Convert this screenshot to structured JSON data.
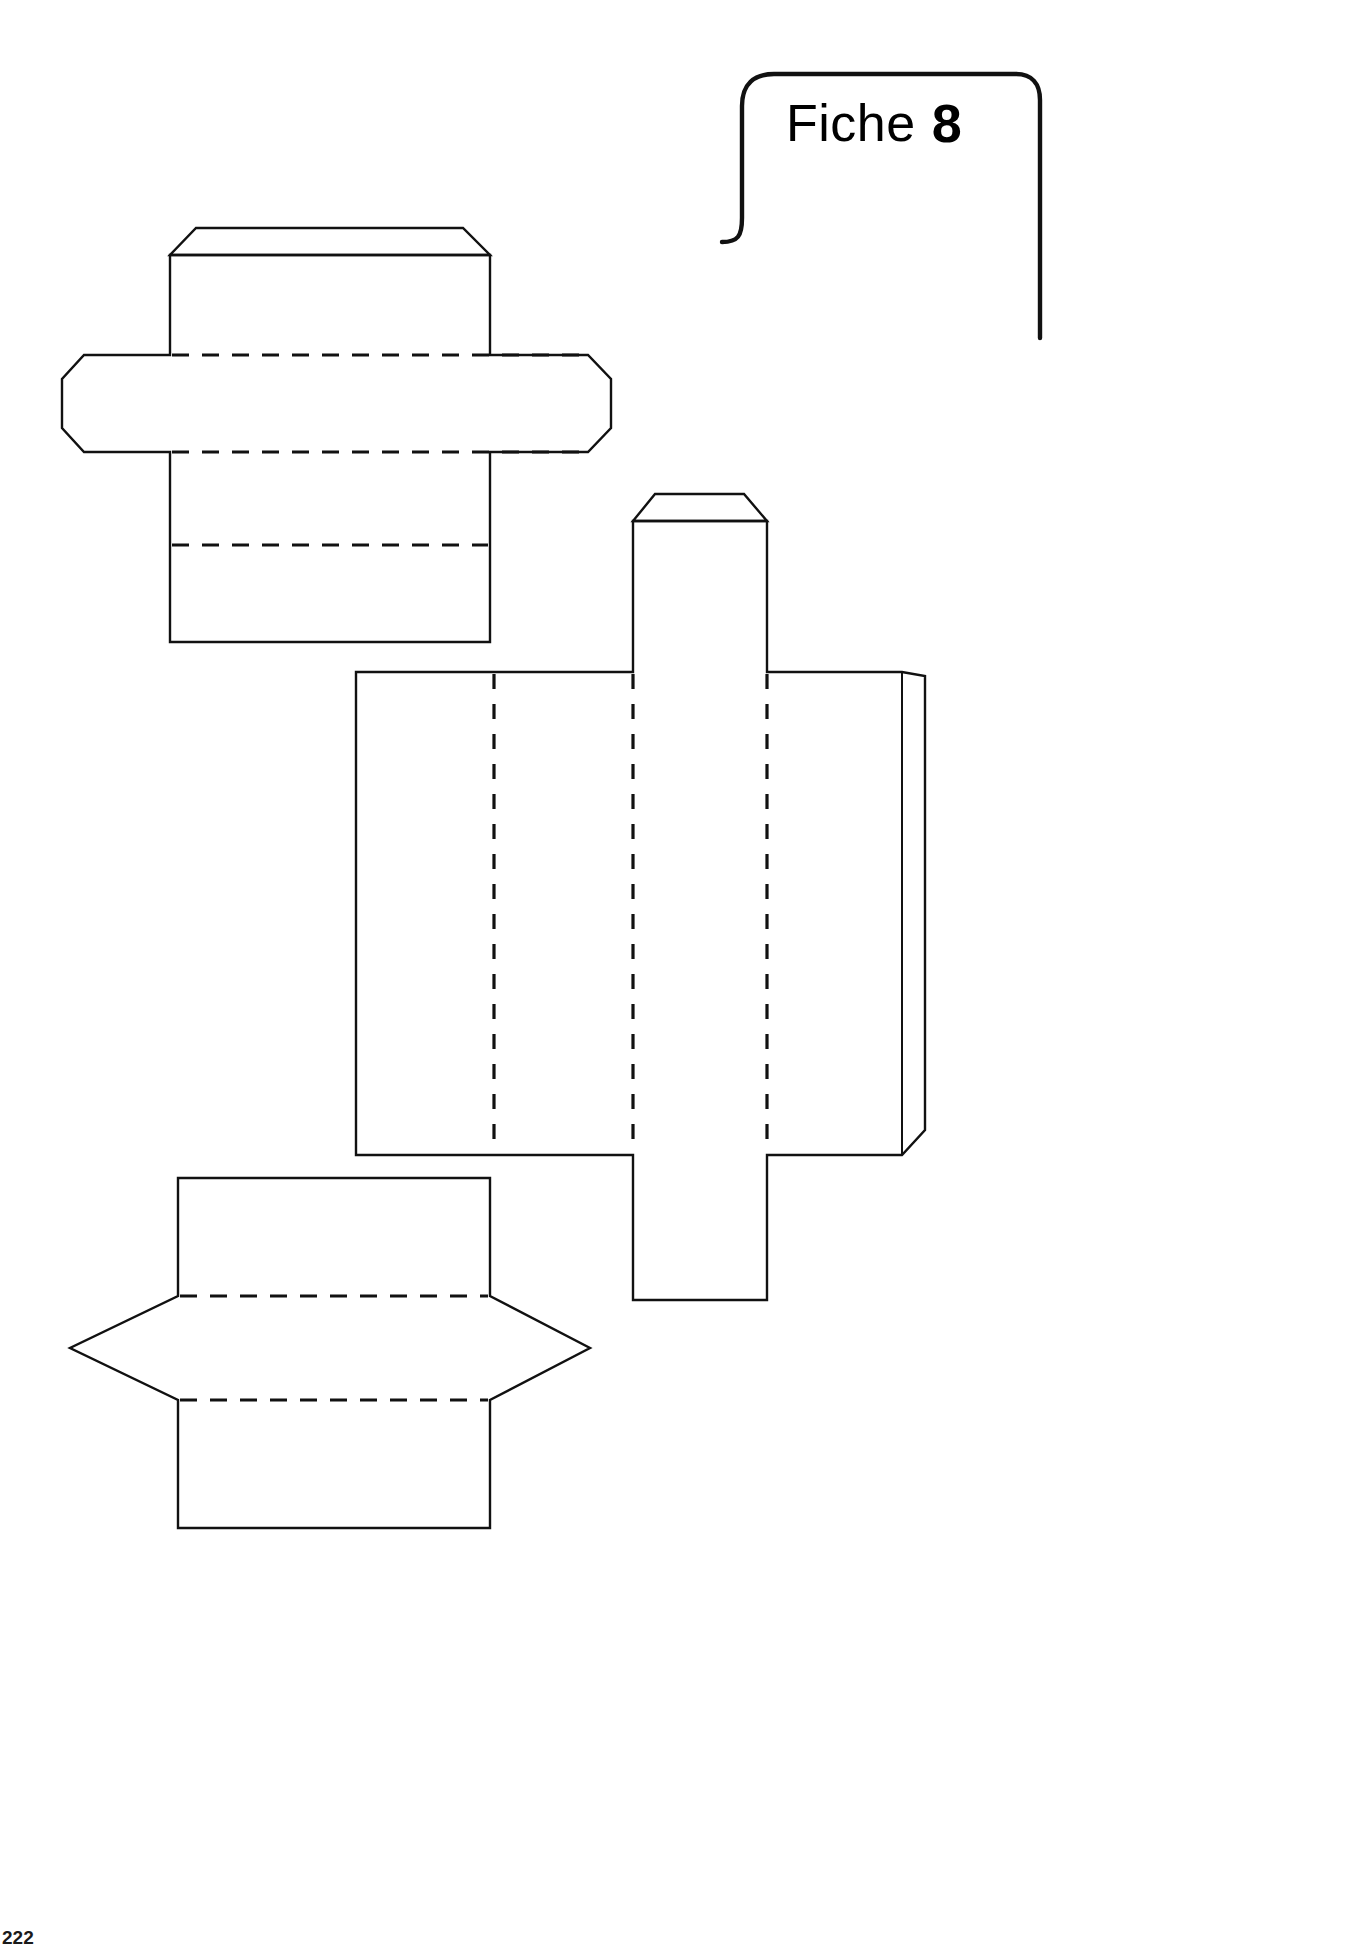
{
  "document": {
    "title": "Fiche 8",
    "page_number": "222",
    "sheet_width": 1346,
    "sheet_height": 1947,
    "background_color": "#ffffff",
    "line_color": "#111111"
  },
  "header": {
    "badge_word": "Fiche",
    "badge_number": "8",
    "shape": "open-left rounded tag with hook",
    "icon_name": "fiche-tag-bracket"
  },
  "legend": {
    "cut_line_style": "solid",
    "fold_line_style": "dashed"
  },
  "nets": [
    {
      "id": "net-top-left",
      "name": "Patron de boîte — haut gauche",
      "description": "Boîte en croix avec rabat supérieur biseauté et languette gauche octogonale",
      "bounds": {
        "x": 62,
        "y": 222,
        "width": 556,
        "height": 424
      },
      "panels": [
        {
          "name": "rabat-superieur",
          "kind": "flap",
          "edge": "top",
          "bevelled": true
        },
        {
          "name": "panneau-haut",
          "kind": "face"
        },
        {
          "name": "languette-gauche",
          "kind": "tab",
          "edge": "left",
          "bevelled": true
        },
        {
          "name": "bande-centrale",
          "kind": "face"
        },
        {
          "name": "languette-droite",
          "kind": "tab",
          "edge": "right",
          "bevelled": true
        },
        {
          "name": "panneau-bas",
          "kind": "face"
        }
      ],
      "fold_lines": 3
    },
    {
      "id": "net-middle-right",
      "name": "Patron de boîte — centre droite",
      "description": "Grand patron horizontal à quatre panneaux, cheminée verticale centrale et rabat droit",
      "bounds": {
        "x": 356,
        "y": 494,
        "width": 588,
        "height": 806
      },
      "panels": [
        {
          "name": "panneau-1",
          "kind": "face"
        },
        {
          "name": "panneau-2",
          "kind": "face"
        },
        {
          "name": "panneau-3",
          "kind": "face"
        },
        {
          "name": "panneau-4",
          "kind": "face"
        },
        {
          "name": "cheminee-verticale",
          "kind": "face",
          "edge": "top-and-bottom",
          "bevelled": true
        },
        {
          "name": "rabat-droit",
          "kind": "flap",
          "edge": "right",
          "bevelled": true
        }
      ],
      "fold_lines": 3
    },
    {
      "id": "net-bottom-left",
      "name": "Patron de boîte — bas gauche",
      "description": "Patron hexagonal à pointes latérales avec panneaux haut et bas",
      "bounds": {
        "x": 70,
        "y": 1178,
        "width": 520,
        "height": 352
      },
      "panels": [
        {
          "name": "panneau-superieur",
          "kind": "face"
        },
        {
          "name": "bande-hexagonale",
          "kind": "face",
          "pointed": true
        },
        {
          "name": "panneau-inferieur",
          "kind": "face"
        }
      ],
      "fold_lines": 2
    }
  ]
}
